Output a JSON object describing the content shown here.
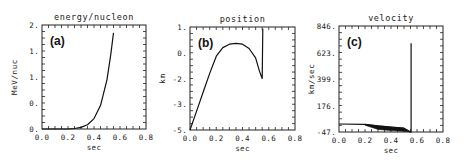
{
  "chart_data": [
    {
      "type": "line",
      "panel_label": "(a)",
      "title": "energy/nucleon",
      "xlabel": "sec",
      "ylabel": "MeV/nuc",
      "xticks": [
        "0.0",
        "0.2",
        "0.4",
        "0.6",
        "0.8"
      ],
      "yticks": [
        "2.",
        "1.",
        "1.",
        "0.",
        "0."
      ],
      "xlim": [
        0.0,
        0.8
      ],
      "ylim": [
        0.0,
        2.0
      ],
      "grid": false,
      "series": [
        {
          "name": "energy/nucleon",
          "x": [
            0.0,
            0.1,
            0.2,
            0.25,
            0.3,
            0.35,
            0.4,
            0.45,
            0.5,
            0.53,
            0.55
          ],
          "y": [
            0.0,
            0.0,
            0.0,
            0.01,
            0.03,
            0.08,
            0.2,
            0.45,
            0.95,
            1.45,
            1.85
          ]
        }
      ]
    },
    {
      "type": "line",
      "panel_label": "(b)",
      "title": "position",
      "xlabel": "sec",
      "ylabel": "km",
      "xticks": [
        "0.0",
        "0.2",
        "0.4",
        "0.6",
        "0.8"
      ],
      "yticks": [
        "1.",
        "0.",
        "-2.",
        "-3.",
        "-5."
      ],
      "xlim": [
        0.0,
        0.8
      ],
      "ylim": [
        -5.0,
        1.0
      ],
      "grid": false,
      "series": [
        {
          "name": "position",
          "x": [
            0.0,
            0.05,
            0.1,
            0.15,
            0.2,
            0.25,
            0.3,
            0.35,
            0.4,
            0.45,
            0.5,
            0.53,
            0.55,
            0.555
          ],
          "y": [
            -5.0,
            -3.9,
            -2.8,
            -1.7,
            -0.7,
            -0.2,
            0.0,
            0.05,
            0.0,
            -0.25,
            -0.8,
            -1.6,
            -2.0,
            0.9
          ]
        }
      ]
    },
    {
      "type": "line",
      "panel_label": "(c)",
      "title": "velocity",
      "xlabel": "sec",
      "ylabel": "km/sec",
      "xticks": [
        "0.0",
        "0.2",
        "0.4",
        "0.6",
        "0.8"
      ],
      "yticks": [
        "846.",
        "623.",
        "399.",
        "176.",
        "-47."
      ],
      "xlim": [
        0.0,
        0.8
      ],
      "ylim": [
        -47,
        846
      ],
      "grid": false,
      "series": [
        {
          "name": "velocity",
          "x": [
            0.0,
            0.2,
            0.3,
            0.4,
            0.5,
            0.54,
            0.55,
            0.555,
            0.555
          ],
          "y": [
            20,
            18,
            5,
            -5,
            -15,
            -40,
            -47,
            -47,
            700
          ]
        }
      ],
      "annotations": [
        "dense oscillating band between 0.2 and 0.55 sec near the bottom"
      ]
    }
  ]
}
